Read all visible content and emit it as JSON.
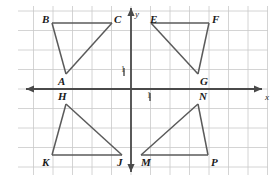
{
  "figure": {
    "width": 278,
    "height": 181,
    "background_color": "#ffffff",
    "grid_color": "#c9c9c9",
    "axis_color": "#4a4a4a",
    "shape_color": "#5a5a5a",
    "label_color": "#1a1a1a"
  },
  "axes": {
    "x_axis_label": "x",
    "y_axis_label": "y",
    "x_unit_tick_label": "1",
    "y_unit_tick_label": "1",
    "origin_px": {
      "x": 131,
      "y": 89
    },
    "grid_spacing_px": 19.5,
    "x_axis_y_px": 89,
    "y_axis_x_px": 131,
    "x_range_px": {
      "start": 26,
      "end": 262
    },
    "y_range_px": {
      "start": 8,
      "end": 172
    }
  },
  "chart_data": {
    "type": "scatter",
    "xlabel": "x",
    "ylabel": "y",
    "grid": true,
    "legend": "none",
    "xlim": [
      -5.5,
      6.7
    ],
    "ylim": [
      -4.3,
      4.2
    ],
    "unit_tick": 1,
    "shapes": [
      {
        "name": "triangle-abc",
        "quadrant": "II",
        "vertices": [
          {
            "label": "A",
            "x": -3.3,
            "y": 0.8,
            "px": 66,
            "py": 74,
            "label_px": {
              "x": 58,
              "y": 76
            }
          },
          {
            "label": "B",
            "x": -4.0,
            "y": 3.4,
            "px": 52,
            "py": 23,
            "label_px": {
              "x": 42,
              "y": 14
            }
          },
          {
            "label": "C",
            "x": -1.0,
            "y": 3.4,
            "px": 112,
            "py": 23,
            "label_px": {
              "x": 114,
              "y": 14
            }
          }
        ],
        "edges": [
          [
            "B",
            "C"
          ],
          [
            "B",
            "A"
          ],
          [
            "A",
            "C"
          ]
        ]
      },
      {
        "name": "triangle-efg",
        "quadrant": "I",
        "vertices": [
          {
            "label": "E",
            "x": 1.0,
            "y": 3.4,
            "px": 151,
            "py": 23,
            "label_px": {
              "x": 150,
              "y": 14
            }
          },
          {
            "label": "F",
            "x": 4.0,
            "y": 3.4,
            "px": 209,
            "py": 23,
            "label_px": {
              "x": 212,
              "y": 14
            }
          },
          {
            "label": "G",
            "x": 3.4,
            "y": 0.8,
            "px": 198,
            "py": 74,
            "label_px": {
              "x": 200,
              "y": 76
            }
          }
        ],
        "edges": [
          [
            "E",
            "F"
          ],
          [
            "E",
            "G"
          ],
          [
            "F",
            "G"
          ]
        ]
      },
      {
        "name": "triangle-hkj",
        "quadrant": "III",
        "vertices": [
          {
            "label": "H",
            "x": -3.3,
            "y": -0.8,
            "px": 66,
            "py": 104,
            "label_px": {
              "x": 58,
              "y": 91
            }
          },
          {
            "label": "K",
            "x": -4.0,
            "y": -3.4,
            "px": 52,
            "py": 155,
            "label_px": {
              "x": 42,
              "y": 157
            }
          },
          {
            "label": "J",
            "x": -0.5,
            "y": -3.4,
            "px": 122,
            "py": 155,
            "label_px": {
              "x": 117,
              "y": 157
            }
          }
        ],
        "edges": [
          [
            "H",
            "K"
          ],
          [
            "H",
            "J"
          ],
          [
            "K",
            "J"
          ]
        ]
      },
      {
        "name": "triangle-mnp",
        "quadrant": "IV",
        "vertices": [
          {
            "label": "M",
            "x": 0.5,
            "y": -3.4,
            "px": 141,
            "py": 155,
            "label_px": {
              "x": 141,
              "y": 157
            }
          },
          {
            "label": "N",
            "x": 3.4,
            "y": -0.8,
            "px": 198,
            "py": 104,
            "label_px": {
              "x": 199,
              "y": 91
            }
          },
          {
            "label": "P",
            "x": 4.0,
            "y": -3.4,
            "px": 208,
            "py": 155,
            "label_px": {
              "x": 211,
              "y": 157
            }
          }
        ],
        "edges": [
          [
            "M",
            "N"
          ],
          [
            "N",
            "P"
          ],
          [
            "M",
            "P"
          ]
        ]
      }
    ]
  },
  "labels": {
    "A": "A",
    "B": "B",
    "C": "C",
    "E": "E",
    "F": "F",
    "G": "G",
    "H": "H",
    "J": "J",
    "K": "K",
    "M": "M",
    "N": "N",
    "P": "P",
    "x_axis": "x",
    "y_axis": "y",
    "x_unit": "1",
    "y_unit": "1"
  }
}
